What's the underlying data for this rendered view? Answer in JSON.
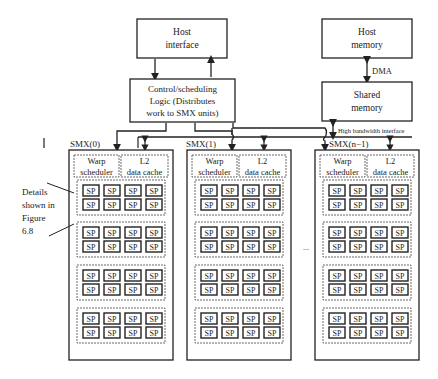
{
  "host_interface": {
    "line1": "Host",
    "line2": "interface"
  },
  "host_memory": {
    "line1": "Host",
    "line2": "memory"
  },
  "dma_label": "DMA",
  "shared_memory": {
    "line1": "Shared",
    "line2": "memory"
  },
  "control_logic": {
    "line1": "Control/scheduling",
    "line2": "Logic (Distributes",
    "line3": "work to SMX units)"
  },
  "high_bandwidth_label": "High bandwidth interface",
  "details_note": {
    "line1": "Details",
    "line2": "shown in",
    "line3": "Figure",
    "line4": "6.8"
  },
  "ellipsis": "...",
  "smx_units": [
    {
      "label": "SMX(0)"
    },
    {
      "label": "SMX(1)"
    },
    {
      "label": "SMX(n−1)"
    }
  ],
  "warp_scheduler": {
    "line1": "Warp",
    "line2": "scheduler"
  },
  "l2_cache": {
    "line1": "L2",
    "line2": "data cache"
  },
  "sp_label": "SP",
  "sp_groups_per_smx": 4,
  "sp_per_group": 8
}
